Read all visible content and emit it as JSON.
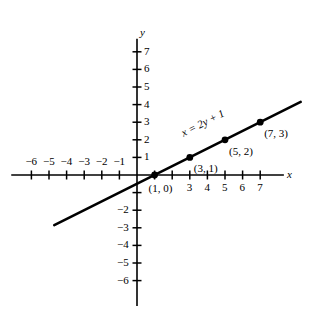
{
  "chart_data": {
    "type": "line",
    "title": "",
    "xlabel": "x",
    "ylabel": "y",
    "equation": "x = 2y + 1",
    "xlim": [
      -7,
      8
    ],
    "ylim": [
      -7,
      8
    ],
    "grid": false,
    "legend": "none",
    "series": [
      {
        "name": "x = 2y + 1",
        "x": [
          -4.7,
          9.3
        ],
        "y": [
          -2.85,
          4.15
        ]
      }
    ],
    "points": [
      {
        "x": 1,
        "y": 0,
        "label": "(1, 0)"
      },
      {
        "x": 3,
        "y": 1,
        "label": "(3, 1)"
      },
      {
        "x": 5,
        "y": 2,
        "label": "(5, 2)"
      },
      {
        "x": 7,
        "y": 3,
        "label": "(7, 3)"
      }
    ],
    "x_ticks": [
      -6,
      -5,
      -4,
      -3,
      -2,
      -1,
      1,
      2,
      3,
      4,
      5,
      6,
      7
    ],
    "y_ticks": [
      -6,
      -5,
      -4,
      -3,
      -2,
      -1,
      1,
      2,
      3,
      4,
      5,
      6,
      7
    ],
    "x_tick_labels": [
      {
        "value": -6,
        "text": "−6",
        "side": "above"
      },
      {
        "value": -5,
        "text": "−5",
        "side": "above"
      },
      {
        "value": -4,
        "text": "−4",
        "side": "above"
      },
      {
        "value": -3,
        "text": "−3",
        "side": "above"
      },
      {
        "value": -2,
        "text": "−2",
        "side": "above"
      },
      {
        "value": -1,
        "text": "−1",
        "side": "above"
      },
      {
        "value": 3,
        "text": "3",
        "side": "below"
      },
      {
        "value": 4,
        "text": "4",
        "side": "below"
      },
      {
        "value": 5,
        "text": "5",
        "side": "below"
      },
      {
        "value": 6,
        "text": "6",
        "side": "below"
      },
      {
        "value": 7,
        "text": "7",
        "side": "below"
      }
    ],
    "y_tick_labels": [
      {
        "value": 7,
        "text": "7",
        "side": "right"
      },
      {
        "value": 6,
        "text": "6",
        "side": "right"
      },
      {
        "value": 5,
        "text": "5",
        "side": "right"
      },
      {
        "value": 4,
        "text": "4",
        "side": "right"
      },
      {
        "value": 3,
        "text": "3",
        "side": "right"
      },
      {
        "value": 2,
        "text": "2",
        "side": "right"
      },
      {
        "value": 1,
        "text": "1",
        "side": "right"
      },
      {
        "value": -2,
        "text": "−2",
        "side": "left"
      },
      {
        "value": -3,
        "text": "−3",
        "side": "left"
      },
      {
        "value": -4,
        "text": "−4",
        "side": "left"
      },
      {
        "value": -5,
        "text": "−5",
        "side": "left"
      },
      {
        "value": -6,
        "text": "−6",
        "side": "left"
      }
    ],
    "colors": {
      "ink": "#000000",
      "background": "#ffffff"
    }
  },
  "axes": {
    "x_letter": "x",
    "y_letter": "y"
  }
}
